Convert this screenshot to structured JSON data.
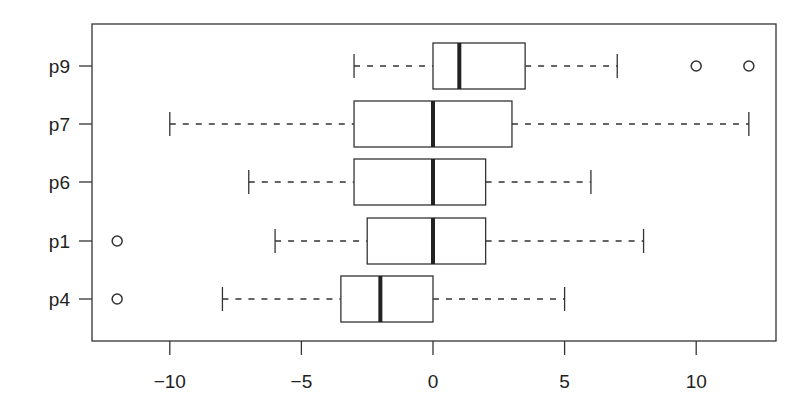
{
  "chart_data": {
    "type": "boxplot",
    "orientation": "horizontal",
    "title": "",
    "xlabel": "",
    "ylabel": "",
    "xlim": [
      -13,
      13
    ],
    "x_ticks": [
      -10,
      -5,
      0,
      5,
      10
    ],
    "x_tick_labels": [
      "−10",
      "−5",
      "0",
      "5",
      "10"
    ],
    "grid": false,
    "legend": null,
    "categories": [
      "p9",
      "p7",
      "p6",
      "p1",
      "p4"
    ],
    "series": [
      {
        "name": "p9",
        "whisker_low": -3,
        "q1": 0,
        "median": 1,
        "q3": 3.5,
        "whisker_high": 7,
        "outliers": [
          10,
          12
        ]
      },
      {
        "name": "p7",
        "whisker_low": -10,
        "q1": -3,
        "median": 0,
        "q3": 3,
        "whisker_high": 12,
        "outliers": []
      },
      {
        "name": "p6",
        "whisker_low": -7,
        "q1": -3,
        "median": 0,
        "q3": 2,
        "whisker_high": 6,
        "outliers": []
      },
      {
        "name": "p1",
        "whisker_low": -6,
        "q1": -2.5,
        "median": 0,
        "q3": 2,
        "whisker_high": 8,
        "outliers": [
          -12
        ]
      },
      {
        "name": "p4",
        "whisker_low": -8,
        "q1": -3.5,
        "median": -2,
        "q3": 0,
        "whisker_high": 5,
        "outliers": [
          -12
        ]
      }
    ]
  }
}
